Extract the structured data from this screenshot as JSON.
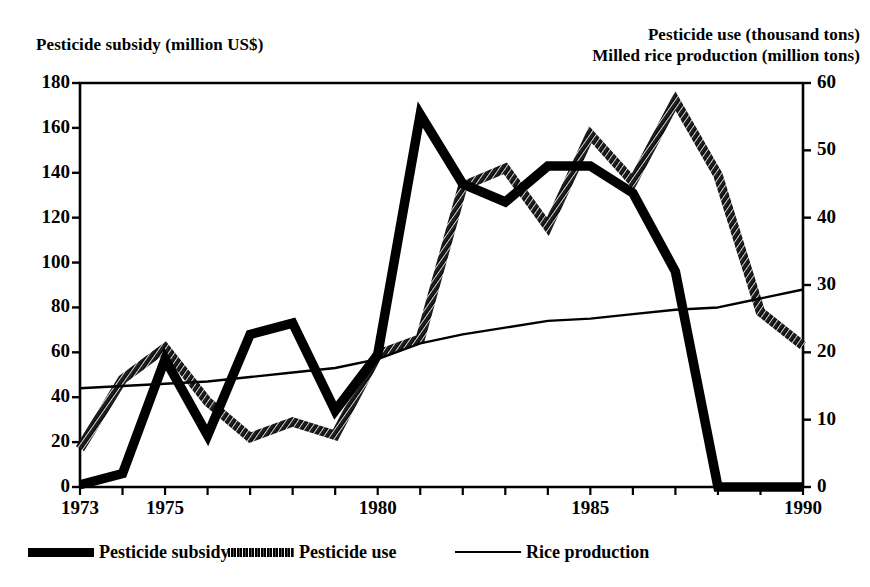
{
  "chart_data": {
    "type": "line",
    "title": "",
    "left_axis": {
      "label": "Pesticide subsidy (million US$)",
      "min": 0,
      "max": 180,
      "tick_step": 20,
      "ticks": [
        "0",
        "20",
        "40",
        "60",
        "80",
        "100",
        "120",
        "140",
        "160",
        "180"
      ]
    },
    "right_axis": {
      "label_line1": "Pesticide use (thousand tons)",
      "label_line2": "Milled rice production (million tons)",
      "min": 0,
      "max": 60,
      "tick_step": 10,
      "ticks": [
        "0",
        "10",
        "20",
        "30",
        "40",
        "50",
        "60"
      ]
    },
    "xlabel": "",
    "x": [
      1973,
      1974,
      1975,
      1976,
      1977,
      1978,
      1979,
      1980,
      1981,
      1982,
      1983,
      1984,
      1985,
      1986,
      1987,
      1988,
      1989,
      1990
    ],
    "x_tick_labels": [
      "1973",
      "1975",
      "1980",
      "1985",
      "1990"
    ],
    "x_tick_values": [
      1973,
      1975,
      1980,
      1985,
      1990
    ],
    "xlim": [
      1973,
      1990
    ],
    "grid": false,
    "legend_position": "bottom",
    "series": [
      {
        "name": "Pesticide subsidy",
        "axis": "left",
        "units": "million US$",
        "style": "thick-solid",
        "values": [
          1,
          6,
          57,
          23,
          68,
          73,
          34,
          59,
          166,
          135,
          127,
          143,
          143,
          131,
          96,
          0,
          0,
          0
        ]
      },
      {
        "name": "Pesticide use",
        "axis": "right",
        "units": "thousand tons",
        "style": "thick-textured",
        "values_left_scale": [
          17,
          48,
          62,
          38,
          22,
          29,
          23,
          59,
          66,
          134,
          142,
          116,
          157,
          136,
          172,
          139,
          78,
          63
        ],
        "values": [
          5.7,
          16.0,
          20.7,
          12.7,
          7.3,
          9.7,
          7.7,
          19.7,
          22.0,
          44.7,
          47.3,
          38.7,
          52.3,
          45.3,
          57.3,
          46.3,
          26.0,
          21.0
        ]
      },
      {
        "name": "Rice production",
        "axis": "right",
        "units": "million tons",
        "style": "thin-solid",
        "values_left_scale": [
          44,
          45,
          46,
          47,
          49,
          51,
          53,
          57,
          64,
          68,
          71,
          74,
          75,
          77,
          79,
          80,
          84,
          88
        ],
        "values": [
          14.7,
          15.0,
          15.3,
          15.7,
          16.3,
          17.0,
          17.7,
          19.0,
          21.3,
          22.7,
          23.7,
          24.7,
          25.0,
          25.7,
          26.3,
          26.7,
          28.0,
          29.3
        ]
      }
    ],
    "legend": [
      {
        "label": "Pesticide subsidy",
        "swatch": "thick-solid-black"
      },
      {
        "label": "Pesticide use",
        "swatch": "thick-textured-black"
      },
      {
        "label": "Rice production",
        "swatch": "thin-line-black"
      }
    ]
  }
}
